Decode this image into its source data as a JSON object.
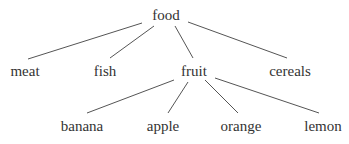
{
  "tree": {
    "root": {
      "label": "food"
    },
    "level1": [
      {
        "label": "meat"
      },
      {
        "label": "fish"
      },
      {
        "label": "fruit"
      },
      {
        "label": "cereals"
      }
    ],
    "level2": [
      {
        "label": "banana"
      },
      {
        "label": "apple"
      },
      {
        "label": "orange"
      },
      {
        "label": "lemon"
      }
    ],
    "edges": [
      [
        "food",
        "meat"
      ],
      [
        "food",
        "fish"
      ],
      [
        "food",
        "fruit"
      ],
      [
        "food",
        "cereals"
      ],
      [
        "fruit",
        "banana"
      ],
      [
        "fruit",
        "apple"
      ],
      [
        "fruit",
        "orange"
      ],
      [
        "fruit",
        "lemon"
      ]
    ],
    "colors": {
      "text": "#333333",
      "line": "#555555",
      "background": "#ffffff"
    }
  }
}
